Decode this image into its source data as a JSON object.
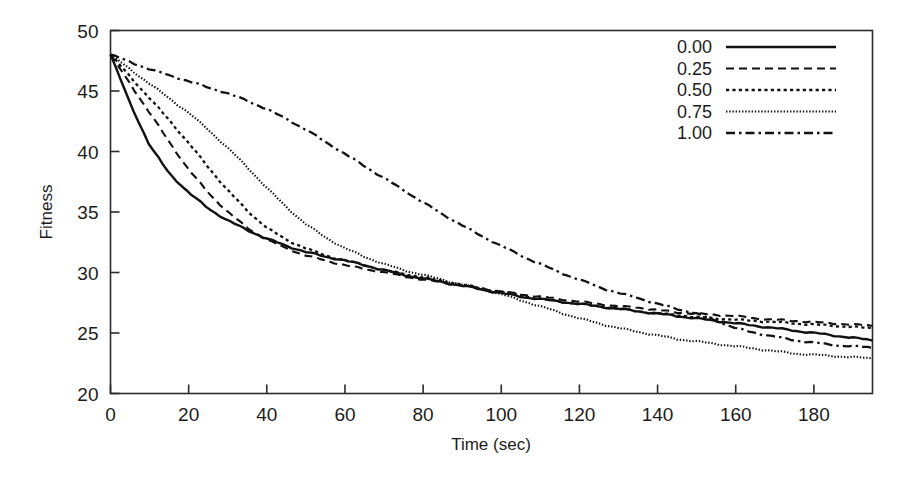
{
  "chart_data": {
    "type": "line",
    "title": "",
    "xlabel": "Time (sec)",
    "ylabel": "Fitness",
    "xlim": [
      0,
      195
    ],
    "ylim": [
      20,
      50
    ],
    "xticks": [
      0,
      20,
      40,
      60,
      80,
      100,
      120,
      140,
      160,
      180
    ],
    "yticks": [
      20,
      25,
      30,
      35,
      40,
      45,
      50
    ],
    "xtick_labels": [
      "0",
      "20",
      "40",
      "60",
      "80",
      "100",
      "120",
      "140",
      "160",
      "180"
    ],
    "ytick_labels": [
      "20",
      "25",
      "30",
      "35",
      "40",
      "45",
      "50"
    ],
    "grid": false,
    "legend_position": "top-right",
    "legend_title": "",
    "x": [
      0,
      5,
      10,
      15,
      20,
      25,
      30,
      35,
      40,
      45,
      50,
      55,
      60,
      65,
      70,
      75,
      80,
      85,
      90,
      95,
      100,
      105,
      110,
      115,
      120,
      125,
      130,
      135,
      140,
      145,
      150,
      155,
      160,
      165,
      170,
      175,
      180,
      185,
      190,
      195
    ],
    "series": [
      {
        "name": "0.00",
        "label": "0.00",
        "linestyle": "solid",
        "dasharray": "none",
        "width": 2.4,
        "values": [
          48.0,
          44.0,
          40.5,
          38.2,
          36.6,
          35.3,
          34.3,
          33.5,
          32.8,
          32.2,
          31.7,
          31.3,
          31.0,
          30.6,
          30.2,
          29.8,
          29.5,
          29.2,
          28.9,
          28.6,
          28.3,
          28.0,
          27.8,
          27.6,
          27.4,
          27.2,
          27.0,
          26.8,
          26.6,
          26.4,
          26.2,
          26.0,
          25.8,
          25.6,
          25.4,
          25.2,
          25.0,
          24.8,
          24.6,
          24.4
        ]
      },
      {
        "name": "0.25",
        "label": "0.25",
        "linestyle": "dashed",
        "dasharray": "8,5",
        "width": 2.1,
        "values": [
          48.0,
          45.6,
          43.2,
          40.8,
          38.5,
          36.6,
          35.0,
          33.7,
          32.7,
          32.0,
          31.4,
          31.0,
          30.6,
          30.3,
          30.0,
          29.7,
          29.4,
          29.2,
          28.9,
          28.7,
          28.4,
          28.2,
          28.0,
          27.8,
          27.6,
          27.4,
          27.2,
          27.1,
          26.9,
          26.7,
          26.6,
          26.5,
          26.4,
          26.2,
          26.1,
          26.0,
          25.9,
          25.8,
          25.7,
          25.6
        ]
      },
      {
        "name": "0.50",
        "label": "0.50",
        "linestyle": "dotted-medium",
        "dasharray": "3.2,3.2",
        "width": 2.3,
        "values": [
          48.0,
          46.2,
          44.4,
          42.6,
          40.7,
          38.7,
          36.8,
          35.1,
          33.7,
          32.7,
          32.0,
          31.4,
          31.0,
          30.6,
          30.2,
          29.9,
          29.6,
          29.3,
          29.0,
          28.7,
          28.4,
          28.1,
          27.8,
          27.6,
          27.4,
          27.2,
          27.0,
          26.8,
          26.6,
          26.5,
          26.3,
          26.2,
          26.1,
          26.0,
          25.9,
          25.8,
          25.7,
          25.6,
          25.5,
          25.4
        ]
      },
      {
        "name": "0.75",
        "label": "0.75",
        "linestyle": "dotted-fine",
        "dasharray": "1.4,1.8",
        "width": 2.1,
        "values": [
          48.0,
          46.8,
          45.6,
          44.4,
          43.2,
          41.8,
          40.3,
          38.7,
          37.0,
          35.4,
          34.0,
          32.9,
          32.0,
          31.3,
          30.7,
          30.2,
          29.8,
          29.4,
          29.0,
          28.6,
          28.2,
          27.7,
          27.2,
          26.7,
          26.2,
          25.8,
          25.4,
          25.1,
          24.8,
          24.5,
          24.3,
          24.1,
          23.9,
          23.7,
          23.5,
          23.3,
          23.2,
          23.1,
          23.0,
          22.9
        ]
      },
      {
        "name": "1.00",
        "label": "1.00",
        "linestyle": "dashdot",
        "dasharray": "9,4,2.5,4",
        "width": 2.3,
        "values": [
          48.0,
          47.4,
          46.8,
          46.3,
          45.8,
          45.3,
          44.8,
          44.2,
          43.5,
          42.7,
          41.8,
          40.8,
          39.8,
          38.8,
          37.8,
          36.8,
          35.8,
          34.8,
          33.9,
          33.0,
          32.2,
          31.4,
          30.7,
          30.0,
          29.4,
          28.8,
          28.3,
          27.9,
          27.4,
          27.0,
          26.6,
          26.0,
          25.4,
          25.0,
          24.7,
          24.4,
          24.2,
          24.0,
          23.9,
          23.8
        ]
      }
    ]
  },
  "legend": {
    "entries": [
      {
        "label": "0.00"
      },
      {
        "label": "0.25"
      },
      {
        "label": "0.50"
      },
      {
        "label": "0.75"
      },
      {
        "label": "1.00"
      }
    ]
  },
  "colors": {
    "line": "#111111",
    "axis": "#2b2b2b",
    "background": "#ffffff",
    "text": "#1c1c1c"
  }
}
